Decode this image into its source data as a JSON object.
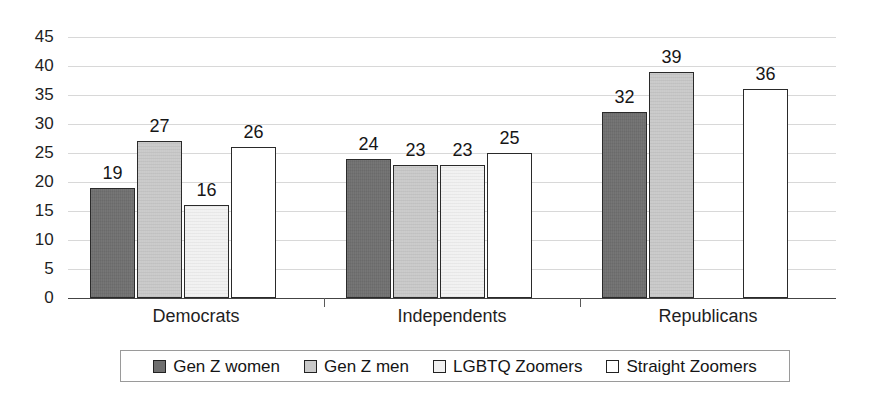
{
  "chart_data": {
    "type": "bar",
    "title": "",
    "subtitle": "",
    "xlabel": "",
    "ylabel": "",
    "ylim": [
      0,
      45
    ],
    "ytick_step": 5,
    "yticks": [
      "45",
      "40",
      "35",
      "30",
      "25",
      "20",
      "15",
      "10",
      "5",
      "0"
    ],
    "grid": true,
    "legend_position": "bottom",
    "categories": [
      "Democrats",
      "Independents",
      "Republicans"
    ],
    "series": [
      {
        "name": "Gen Z women",
        "color": "#6f6f6f",
        "values": [
          19,
          24,
          32
        ]
      },
      {
        "name": "Gen Z men",
        "color": "#c9c9c9",
        "values": [
          27,
          23,
          39
        ]
      },
      {
        "name": "LGBTQ Zoomers",
        "color": "#f1f1f1",
        "values": [
          16,
          23,
          null
        ]
      },
      {
        "name": "Straight Zoomers",
        "color": "#ffffff",
        "values": [
          26,
          25,
          36
        ]
      }
    ],
    "data_labels": [
      [
        "19",
        "27",
        "16",
        "26"
      ],
      [
        "24",
        "23",
        "23",
        "25"
      ],
      [
        "32",
        "39",
        "",
        "36"
      ]
    ]
  },
  "legend": {
    "items": [
      {
        "label": "Gen Z women"
      },
      {
        "label": "Gen Z men"
      },
      {
        "label": "LGBTQ Zoomers"
      },
      {
        "label": "Straight Zoomers"
      }
    ]
  }
}
